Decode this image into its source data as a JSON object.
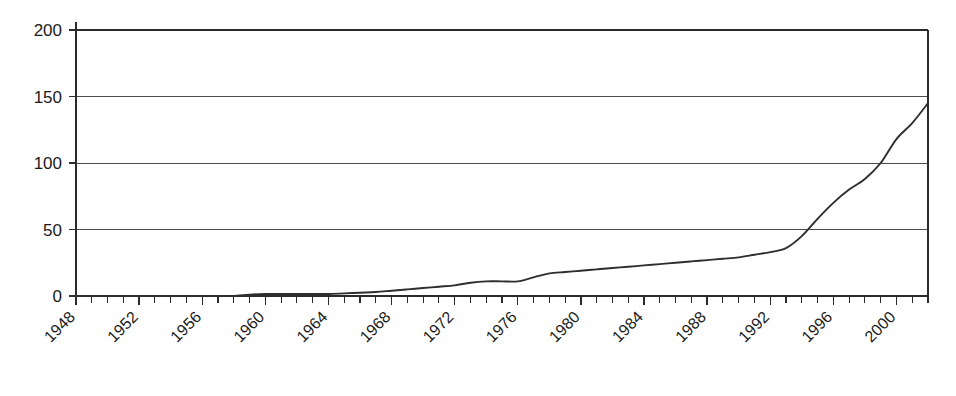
{
  "chart_data": {
    "type": "line",
    "title": "",
    "subtitle": "",
    "xlabel": "",
    "ylabel": "",
    "xlim": [
      1948,
      2002
    ],
    "ylim": [
      0,
      200
    ],
    "grid": true,
    "legend": false,
    "legend_position": "none",
    "y_ticks": [
      0,
      50,
      100,
      150,
      200
    ],
    "y_tick_labels": [
      "0",
      "50",
      "100",
      "150",
      "200"
    ],
    "x_tick_labels": [
      "1948",
      "1952",
      "1956",
      "1960",
      "1964",
      "1968",
      "1972",
      "1976",
      "1980",
      "1984",
      "1988",
      "1992",
      "1996",
      "2000"
    ],
    "x_tick_label_rotation": 45,
    "x_minor_tick_interval": 1,
    "x_major_tick_interval": 4,
    "series": [
      {
        "name": "series-1",
        "color": "#2e2e2e",
        "x": [
          1948,
          1949,
          1950,
          1951,
          1952,
          1953,
          1954,
          1955,
          1956,
          1957,
          1958,
          1959,
          1960,
          1961,
          1962,
          1963,
          1964,
          1965,
          1966,
          1967,
          1968,
          1969,
          1970,
          1971,
          1972,
          1973,
          1974,
          1975,
          1976,
          1977,
          1978,
          1979,
          1980,
          1981,
          1982,
          1983,
          1984,
          1985,
          1986,
          1987,
          1988,
          1989,
          1990,
          1991,
          1992,
          1993,
          1994,
          1995,
          1996,
          1997,
          1998,
          1999,
          2000,
          2001,
          2002
        ],
        "values": [
          0,
          0,
          0,
          0,
          0,
          0,
          0,
          0,
          0,
          0,
          0,
          1,
          1.5,
          1.5,
          1.5,
          1.5,
          1.5,
          2,
          2.5,
          3,
          4,
          5,
          6,
          7,
          8,
          10,
          11,
          11,
          11,
          14,
          17,
          18,
          19,
          20,
          21,
          22,
          23,
          24,
          25,
          26,
          27,
          28,
          29,
          31,
          33,
          36,
          45,
          58,
          70,
          80,
          88,
          100,
          118,
          130,
          145
        ]
      }
    ]
  }
}
